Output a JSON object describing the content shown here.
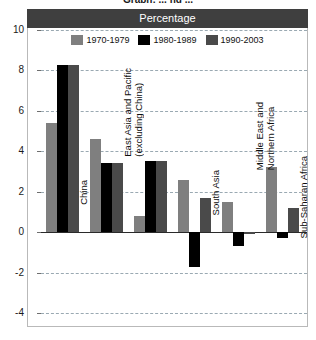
{
  "crop_title": "Graph: ... ng ...",
  "header": {
    "label": "Percentage"
  },
  "legend": {
    "items": [
      {
        "label": "1970-1979",
        "color": "#7f7f7f"
      },
      {
        "label": "1980-1989",
        "color": "#000000"
      },
      {
        "label": "1990-2003",
        "color": "#4a4a4a"
      }
    ]
  },
  "axis": {
    "ticks": [
      "10",
      "8",
      "6",
      "4",
      "2",
      "0",
      "-2",
      "-4"
    ],
    "values": [
      10,
      8,
      6,
      4,
      2,
      0,
      -2,
      -4
    ]
  },
  "chart_data": {
    "type": "bar",
    "title": "Percentage",
    "xlabel": "",
    "ylabel": "Percentage",
    "ylim": [
      -4,
      10
    ],
    "grid": true,
    "legend_position": "top",
    "categories": [
      "China",
      "East Asia and Pacific\n(excluding China)",
      "South Asia",
      "Middle East and\nNorthern Africa",
      "Sub-Saharan Africa",
      "Latin America and\nthe Caribbean"
    ],
    "series": [
      {
        "name": "1970-1979",
        "color": "#7f7f7f",
        "values": [
          5.4,
          4.6,
          0.8,
          2.6,
          1.5,
          3.2
        ]
      },
      {
        "name": "1980-1989",
        "color": "#000000",
        "values": [
          8.25,
          3.4,
          3.5,
          -1.7,
          -0.7,
          -0.3
        ]
      },
      {
        "name": "1990-2003",
        "color": "#4a4a4a",
        "values": [
          8.25,
          3.4,
          3.5,
          1.7,
          -0.1,
          1.2
        ]
      }
    ]
  }
}
